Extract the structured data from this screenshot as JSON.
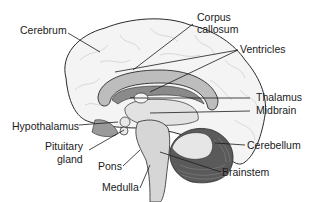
{
  "diagram": {
    "labels": {
      "cerebrum": "Cerebrum",
      "corpus_callosum_1": "Corpus",
      "corpus_callosum_2": "callosum",
      "ventricles": "Ventricles",
      "thalamus": "Thalamus",
      "midbrain": "Midbrain",
      "hypothalamus": "Hypothalamus",
      "pituitary_1": "Pituitary",
      "pituitary_2": "gland",
      "pons": "Pons",
      "medulla": "Medulla",
      "cerebellum": "Cerebellum",
      "brainstem": "Brainstem"
    },
    "colors": {
      "outline": "#2a2a2a",
      "cortex_fill": "#f4f4f4",
      "gyri_lines": "#c8c8c8",
      "corpus_callosum": "#bdbdbd",
      "ventricle": "#8a8a8a",
      "thalamus": "#d6d6d6",
      "cerebellum_dark": "#5a5a5a",
      "brainstem": "#cfcfcf"
    }
  }
}
